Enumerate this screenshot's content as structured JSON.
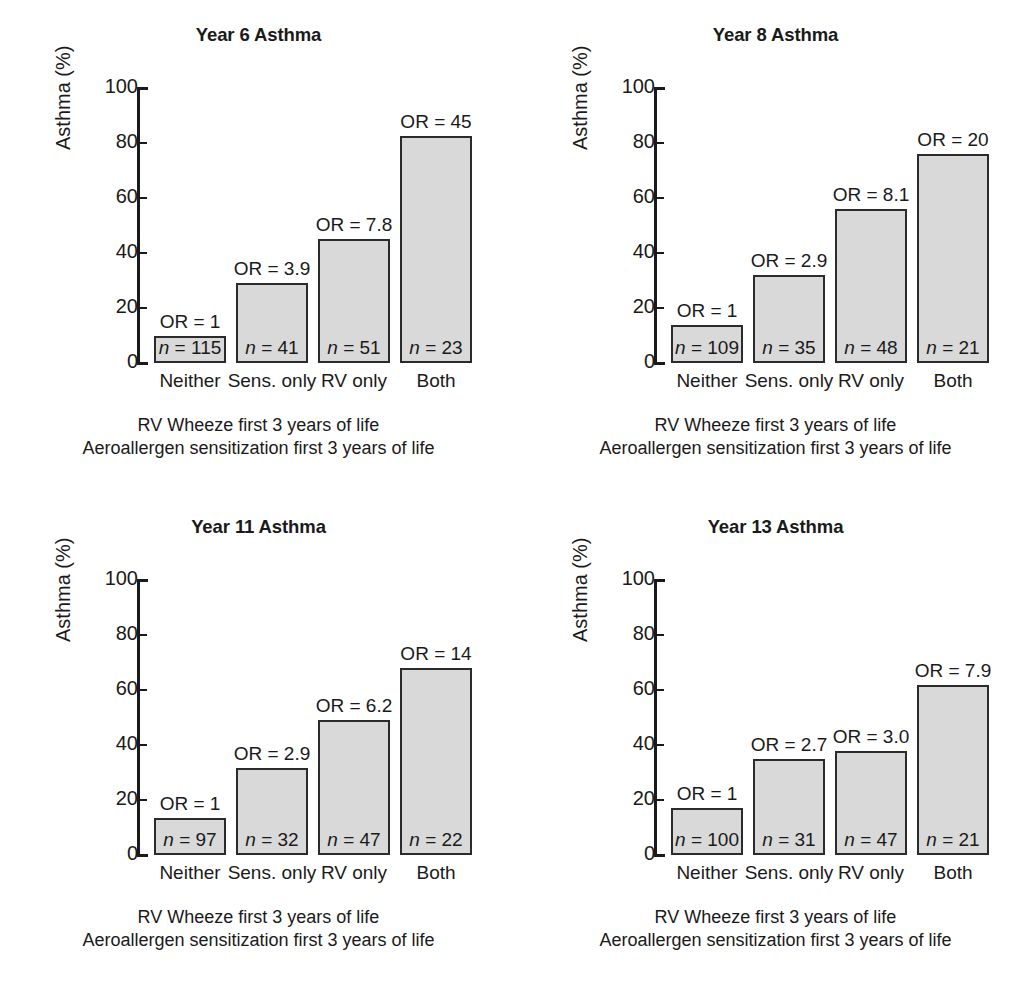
{
  "figure": {
    "axis": {
      "ylabel": "Asthma (%)",
      "ticks": [
        "100",
        "80",
        "60",
        "40",
        "20",
        "0"
      ],
      "tick_values": [
        100,
        80,
        60,
        40,
        20,
        0
      ],
      "ylim": [
        0,
        100
      ]
    },
    "categories": [
      "Neither",
      "Sens. only",
      "RV only",
      "Both"
    ],
    "caption_line1": "RV Wheeze first 3 years of life",
    "caption_line2": "Aeroallergen sensitization first 3 years of life",
    "colors": {
      "bar_fill": "#d9d9d9",
      "bar_border": "#2b2b2b",
      "text": "#1a1a1a",
      "background": "#ffffff"
    }
  },
  "chart_data": [
    {
      "type": "bar",
      "title": "Year 6 Asthma",
      "xlabel": "RV Wheeze first 3 years of life / Aeroallergen sensitization first 3 years of life",
      "ylabel": "Asthma (%)",
      "ylim": [
        0,
        100
      ],
      "grid": false,
      "legend": "none",
      "categories": [
        "Neither",
        "Sens. only",
        "RV only",
        "Both"
      ],
      "values": [
        10,
        29,
        45,
        82.5
      ],
      "odds_ratios": [
        "OR = 1",
        "OR = 3.9",
        "OR = 7.8",
        "OR = 45"
      ],
      "n_values": [
        "115",
        "41",
        "51",
        "23"
      ],
      "n_labels": [
        "n = 115",
        "n = 41",
        "n = 51",
        "n = 23"
      ]
    },
    {
      "type": "bar",
      "title": "Year 8 Asthma",
      "xlabel": "RV Wheeze first 3 years of life / Aeroallergen sensitization first 3 years of life",
      "ylabel": "Asthma (%)",
      "ylim": [
        0,
        100
      ],
      "grid": false,
      "legend": "none",
      "categories": [
        "Neither",
        "Sens. only",
        "RV only",
        "Both"
      ],
      "values": [
        14,
        32,
        56,
        76
      ],
      "odds_ratios": [
        "OR = 1",
        "OR = 2.9",
        "OR = 8.1",
        "OR = 20"
      ],
      "n_values": [
        "109",
        "35",
        "48",
        "21"
      ],
      "n_labels": [
        "n = 109",
        "n = 35",
        "n = 48",
        "n = 21"
      ]
    },
    {
      "type": "bar",
      "title": "Year 11 Asthma",
      "xlabel": "RV Wheeze first 3 years of life / Aeroallergen sensitization first 3 years of life",
      "ylabel": "Asthma (%)",
      "ylim": [
        0,
        100
      ],
      "grid": false,
      "legend": "none",
      "categories": [
        "Neither",
        "Sens. only",
        "RV only",
        "Both"
      ],
      "values": [
        13.5,
        31.5,
        49,
        68
      ],
      "odds_ratios": [
        "OR = 1",
        "OR = 2.9",
        "OR = 6.2",
        "OR = 14"
      ],
      "n_values": [
        "97",
        "32",
        "47",
        "22"
      ],
      "n_labels": [
        "n = 97",
        "n = 32",
        "n = 47",
        "n = 22"
      ]
    },
    {
      "type": "bar",
      "title": "Year 13 Asthma",
      "xlabel": "RV Wheeze first 3 years of life / Aeroallergen sensitization first 3 years of life",
      "ylabel": "Asthma (%)",
      "ylim": [
        0,
        100
      ],
      "grid": false,
      "legend": "none",
      "categories": [
        "Neither",
        "Sens. only",
        "RV only",
        "Both"
      ],
      "values": [
        17,
        35,
        38,
        62
      ],
      "odds_ratios": [
        "OR = 1",
        "OR = 2.7",
        "OR = 3.0",
        "OR = 7.9"
      ],
      "n_values": [
        "100",
        "31",
        "47",
        "21"
      ],
      "n_labels": [
        "n = 100",
        "n = 31",
        "n = 47",
        "n = 21"
      ]
    }
  ]
}
